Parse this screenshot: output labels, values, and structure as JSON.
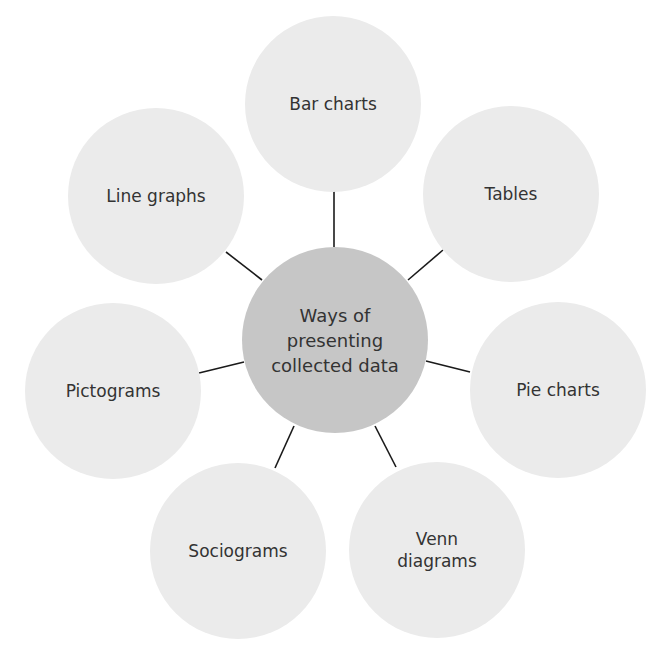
{
  "diagram": {
    "title": "Ways of presenting collected data",
    "center": {
      "label": "Ways of\npresenting\ncollected data",
      "color": "#c6c6c6",
      "cx": 335,
      "cy": 340,
      "r": 93
    },
    "nodes": [
      {
        "id": "bar-charts",
        "label": "Bar charts",
        "cx": 333,
        "cy": 104
      },
      {
        "id": "tables",
        "label": "Tables",
        "cx": 511,
        "cy": 194
      },
      {
        "id": "pie-charts",
        "label": "Pie charts",
        "cx": 558,
        "cy": 390
      },
      {
        "id": "venn-diagrams",
        "label": "Venn\ndiagrams",
        "cx": 437,
        "cy": 550
      },
      {
        "id": "sociograms",
        "label": "Sociograms",
        "cx": 238,
        "cy": 551
      },
      {
        "id": "pictograms",
        "label": "Pictograms",
        "cx": 113,
        "cy": 391
      },
      {
        "id": "line-graphs",
        "label": "Line graphs",
        "cx": 156,
        "cy": 196
      }
    ],
    "outer_color": "#ebebeb",
    "text_color": "#333333",
    "connector_color": "#1a1a1a"
  }
}
